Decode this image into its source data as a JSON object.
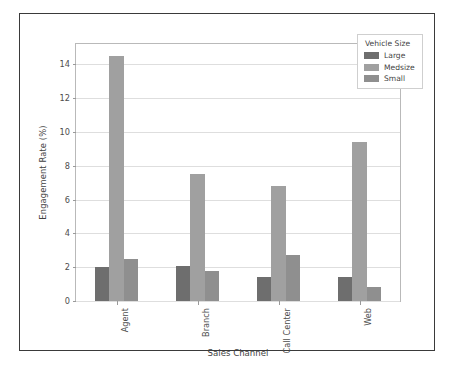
{
  "chart_data": {
    "type": "bar",
    "title": "",
    "xlabel": "Sales Channel",
    "ylabel": "Engagement Rate (%)",
    "categories": [
      "Agent",
      "Branch",
      "Call Center",
      "Web"
    ],
    "series": [
      {
        "name": "Large",
        "values": [
          2.0,
          2.1,
          1.4,
          1.4
        ],
        "color": "#6e6e6e"
      },
      {
        "name": "Medsize",
        "values": [
          14.5,
          7.5,
          6.8,
          9.4
        ],
        "color": "#a0a0a0"
      },
      {
        "name": "Small",
        "values": [
          2.5,
          1.8,
          2.7,
          0.8
        ],
        "color": "#8f8f8f"
      }
    ],
    "ylim": [
      0,
      15.2
    ],
    "yticks": [
      0,
      2,
      4,
      6,
      8,
      10,
      12,
      14
    ],
    "ytick_labels": [
      "0",
      "2",
      "4",
      "6",
      "8",
      "10",
      "12",
      "14"
    ],
    "grid": true,
    "legend": {
      "title": "Vehicle Size",
      "position": "upper right",
      "entries": [
        "Large",
        "Medsize",
        "Small"
      ]
    }
  }
}
